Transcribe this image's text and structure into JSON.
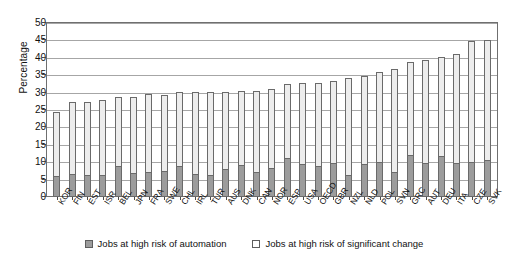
{
  "chart_data": {
    "type": "bar",
    "subtype": "stacked-vertical",
    "title": "",
    "xlabel": "",
    "ylabel": "Percentage",
    "ylim": [
      0,
      50
    ],
    "ytick_step": 5,
    "yticks": [
      0,
      5,
      10,
      15,
      20,
      25,
      30,
      35,
      40,
      45,
      50
    ],
    "grid": true,
    "grid_axis": "y",
    "legend_position": "bottom-center",
    "categories": [
      "KOR",
      "FIN",
      "EST",
      "ISR",
      "BEL",
      "JPN",
      "FRA",
      "SWE",
      "CHL",
      "IRL",
      "TUR",
      "AUS",
      "DNK",
      "CAN",
      "NOR",
      "ESP",
      "USA",
      "OECD",
      "GBR",
      "NZL",
      "NLD",
      "POL",
      "SVN",
      "GRC",
      "AUT",
      "DEU",
      "ITA",
      "CZE",
      "SVK"
    ],
    "series": [
      {
        "name": "Jobs at high risk of automation",
        "color": "#9c9c9c",
        "values": [
          6.0,
          6.5,
          6.4,
          6.4,
          9.0,
          7.0,
          7.3,
          7.5,
          9.0,
          6.5,
          6.2,
          8.0,
          9.2,
          7.2,
          8.4,
          11.3,
          9.6,
          9.0,
          9.8,
          6.3,
          9.5,
          10.0,
          7.2,
          12.2,
          9.8,
          11.8,
          9.8,
          10.0,
          10.6
        ]
      },
      {
        "name": "Jobs at high risk of significant change",
        "color": "#ededed",
        "values": [
          18.5,
          20.8,
          20.9,
          21.6,
          19.7,
          21.8,
          22.2,
          21.9,
          21.1,
          23.7,
          24.1,
          22.2,
          21.3,
          23.3,
          22.6,
          21.1,
          23.1,
          23.9,
          23.6,
          27.9,
          25.3,
          26.0,
          29.6,
          26.6,
          29.6,
          28.4,
          31.4,
          34.8,
          34.6
        ]
      }
    ],
    "totals": [
      24.5,
      27.3,
      27.3,
      28.0,
      28.7,
      28.8,
      29.5,
      29.4,
      30.1,
      30.2,
      30.3,
      30.2,
      30.5,
      30.5,
      31.0,
      32.4,
      32.7,
      32.9,
      33.4,
      34.2,
      34.8,
      36.0,
      36.8,
      38.8,
      39.4,
      40.2,
      41.2,
      44.8,
      45.2
    ]
  },
  "legend": {
    "items": [
      {
        "label": "Jobs at high risk of automation"
      },
      {
        "label": "Jobs at high risk of significant change"
      }
    ]
  }
}
